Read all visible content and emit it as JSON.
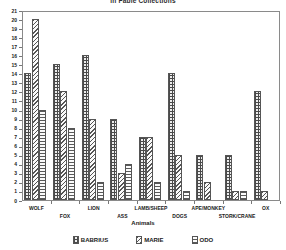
{
  "chart_data": {
    "type": "bar",
    "title": "in Fable Collections",
    "xlabel": "Animals",
    "ylabel": "",
    "ylim": [
      0,
      21
    ],
    "ytick_labels": [
      "0",
      "1",
      "2",
      "3",
      "4",
      "5",
      "6",
      "7",
      "8",
      "9",
      "10",
      "11",
      "12",
      "13",
      "14",
      "15",
      "16",
      "17",
      "18",
      "19",
      "20",
      "21"
    ],
    "grid": false,
    "legend_position": "bottom",
    "categories": [
      "WOLF",
      "FOX",
      "LION",
      "ASS",
      "LAMB/SHEEP",
      "DOGS",
      "APE/MONKEY",
      "STORK/CRANE",
      "OX"
    ],
    "series": [
      {
        "name": "BABRIUS",
        "values": [
          14,
          15,
          16,
          9,
          7,
          14,
          5,
          5,
          12
        ]
      },
      {
        "name": "MARIE",
        "values": [
          20,
          12,
          9,
          3,
          7,
          5,
          2,
          1,
          1
        ]
      },
      {
        "name": "ODO",
        "values": [
          10,
          8,
          2,
          4,
          2,
          1,
          0,
          1,
          0
        ]
      }
    ]
  },
  "legend": {
    "items": [
      {
        "label": "BABRIUS"
      },
      {
        "label": "MARIE"
      },
      {
        "label": "ODO"
      }
    ]
  }
}
